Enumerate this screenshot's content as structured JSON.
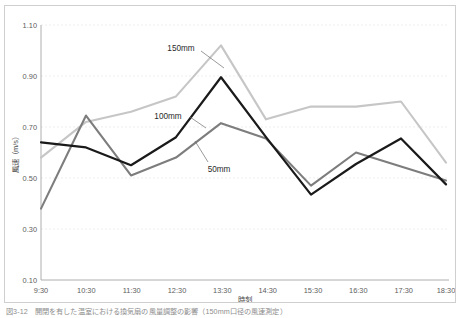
{
  "figure": {
    "caption": "図3-12　開閉を有した温室における換気扇の風量調整の影響（150mm口径の風速測定）"
  },
  "chart_data": {
    "type": "line",
    "title": "",
    "xlabel": "時刻",
    "ylabel": "風速（m/s）",
    "categories": [
      "9:30",
      "10:30",
      "11:30",
      "12:30",
      "13:30",
      "14:30",
      "15:30",
      "16:30",
      "17:30",
      "18:30"
    ],
    "ylim": [
      0.1,
      1.1
    ],
    "ytick_labels": [
      "1.10",
      "0.90",
      "0.70",
      "0.50",
      "0.30",
      "0.10"
    ],
    "ytick_values": [
      1.1,
      0.9,
      0.7,
      0.5,
      0.3,
      0.1
    ],
    "grid": true,
    "legend_position": "inline-annotation",
    "series": [
      {
        "name": "150mm",
        "color": "#c6c6c6",
        "values": [
          0.58,
          0.72,
          0.76,
          0.82,
          1.02,
          0.73,
          0.78,
          0.78,
          0.8,
          0.56
        ]
      },
      {
        "name": "100mm",
        "color": "#1a1a1a",
        "values": [
          0.64,
          0.62,
          0.55,
          0.66,
          0.895,
          0.66,
          0.435,
          0.555,
          0.655,
          0.475
        ]
      },
      {
        "name": "50mm",
        "color": "#7d7d7d",
        "values": [
          0.38,
          0.745,
          0.51,
          0.58,
          0.715,
          0.655,
          0.47,
          0.6,
          0.545,
          0.49
        ]
      }
    ],
    "annotations": [
      {
        "label": "150mm",
        "x_px": 176,
        "y_px": 46
      },
      {
        "label": "100mm",
        "x_px": 165,
        "y_px": 110
      },
      {
        "label": "50mm",
        "x_px": 212,
        "y_px": 163
      }
    ]
  }
}
